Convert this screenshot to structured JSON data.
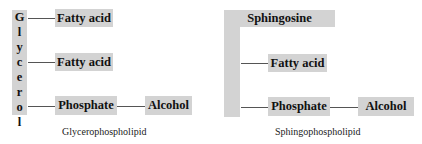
{
  "glycerophospholipid": {
    "backbone_letters": [
      "G",
      "l",
      "y",
      "c",
      "e",
      "r",
      "o",
      "l"
    ],
    "backbone_label": "Glycerol",
    "fatty_acid_1": "Fatty acid",
    "fatty_acid_2": "Fatty acid",
    "phosphate": "Phosphate",
    "alcohol": "Alcohol",
    "caption": "Glycerophospholipid"
  },
  "sphingophospholipid": {
    "backbone_label": "Sphingosine",
    "fatty_acid": "Fatty acid",
    "phosphate": "Phosphate",
    "alcohol": "Alcohol",
    "caption": "Sphingophospholipid"
  },
  "colors": {
    "box_fill": "#d3d3d3",
    "connector": "#555555",
    "text": "#111111"
  }
}
